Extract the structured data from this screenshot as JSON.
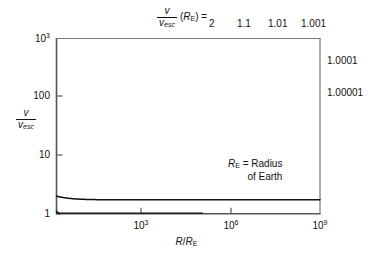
{
  "chart_data": {
    "type": "line",
    "title": "",
    "xlabel": "R/R_E",
    "ylabel": "v/v_esc",
    "xscale": "log",
    "yscale": "log",
    "xlim": [
      1,
      1000000000
    ],
    "ylim": [
      1,
      1000
    ],
    "grid": false,
    "legend_position": "top and right edge inline labels",
    "x_ticks": [
      "10^3",
      "10^6",
      "10^9"
    ],
    "x_tick_values": [
      1000,
      1000000,
      1000000000
    ],
    "y_ticks": [
      "10^3",
      "100",
      "10",
      "1"
    ],
    "y_tick_values": [
      1000,
      100,
      10,
      1
    ],
    "annotation": "R_E = Radius of Earth",
    "series": [
      {
        "name": "2",
        "k": 2.0,
        "label_position": "top",
        "description": "v/v_esc(R_E) = 2; starts at 2 on left edge, rises with slope 1/2 in log-log"
      },
      {
        "name": "1.1",
        "k": 1.1,
        "label_position": "top",
        "description": "starts at 1.1 on left edge"
      },
      {
        "name": "1.01",
        "k": 1.01,
        "label_position": "top",
        "description": "starts at 1.01 on left edge"
      },
      {
        "name": "1.001",
        "k": 1.001,
        "label_position": "top",
        "description": "starts at 1.001 on left edge"
      },
      {
        "name": "1.0001",
        "k": 1.0001,
        "label_position": "right",
        "description": "exits right edge near v/v_esc = 400"
      },
      {
        "name": "1.00001",
        "k": 1.00001,
        "label_position": "right",
        "description": "exits right edge near v/v_esc = 130"
      }
    ],
    "curve_formula": "v/v_esc = sqrt(k^2 - 1 + R_E/R)"
  },
  "header": {
    "ratio_numerator": "v",
    "ratio_denominator": "v",
    "ratio_denominator_sub": "esc",
    "arg_open": "(",
    "arg_symbol": "R",
    "arg_sub": "E",
    "arg_close": ")",
    "equals": "=",
    "values": [
      "2",
      "1.1",
      "1.01",
      "1.001"
    ]
  },
  "right_labels": [
    "1.0001",
    "1.00001"
  ],
  "yaxis": {
    "title_numerator": "v",
    "title_denominator": "v",
    "title_denominator_sub": "esc",
    "ticks": [
      {
        "base": "10",
        "exp": "3"
      },
      {
        "base": "100",
        "exp": ""
      },
      {
        "base": "10",
        "exp": ""
      },
      {
        "base": "1",
        "exp": ""
      }
    ]
  },
  "xaxis": {
    "title_numerator": "R",
    "title_denominator": "R",
    "title_sub": "E",
    "ticks": [
      {
        "base": "10",
        "exp": "3"
      },
      {
        "base": "10",
        "exp": "6"
      },
      {
        "base": "10",
        "exp": "9"
      }
    ]
  },
  "annotation": {
    "line1_symbol": "R",
    "line1_sub": "E",
    "line1_text": " = Radius",
    "line2_text": "of Earth"
  },
  "colors": {
    "background": "#ffffff",
    "ink": "#111111",
    "axis": "#4a4a4a",
    "curve": "#111111"
  }
}
